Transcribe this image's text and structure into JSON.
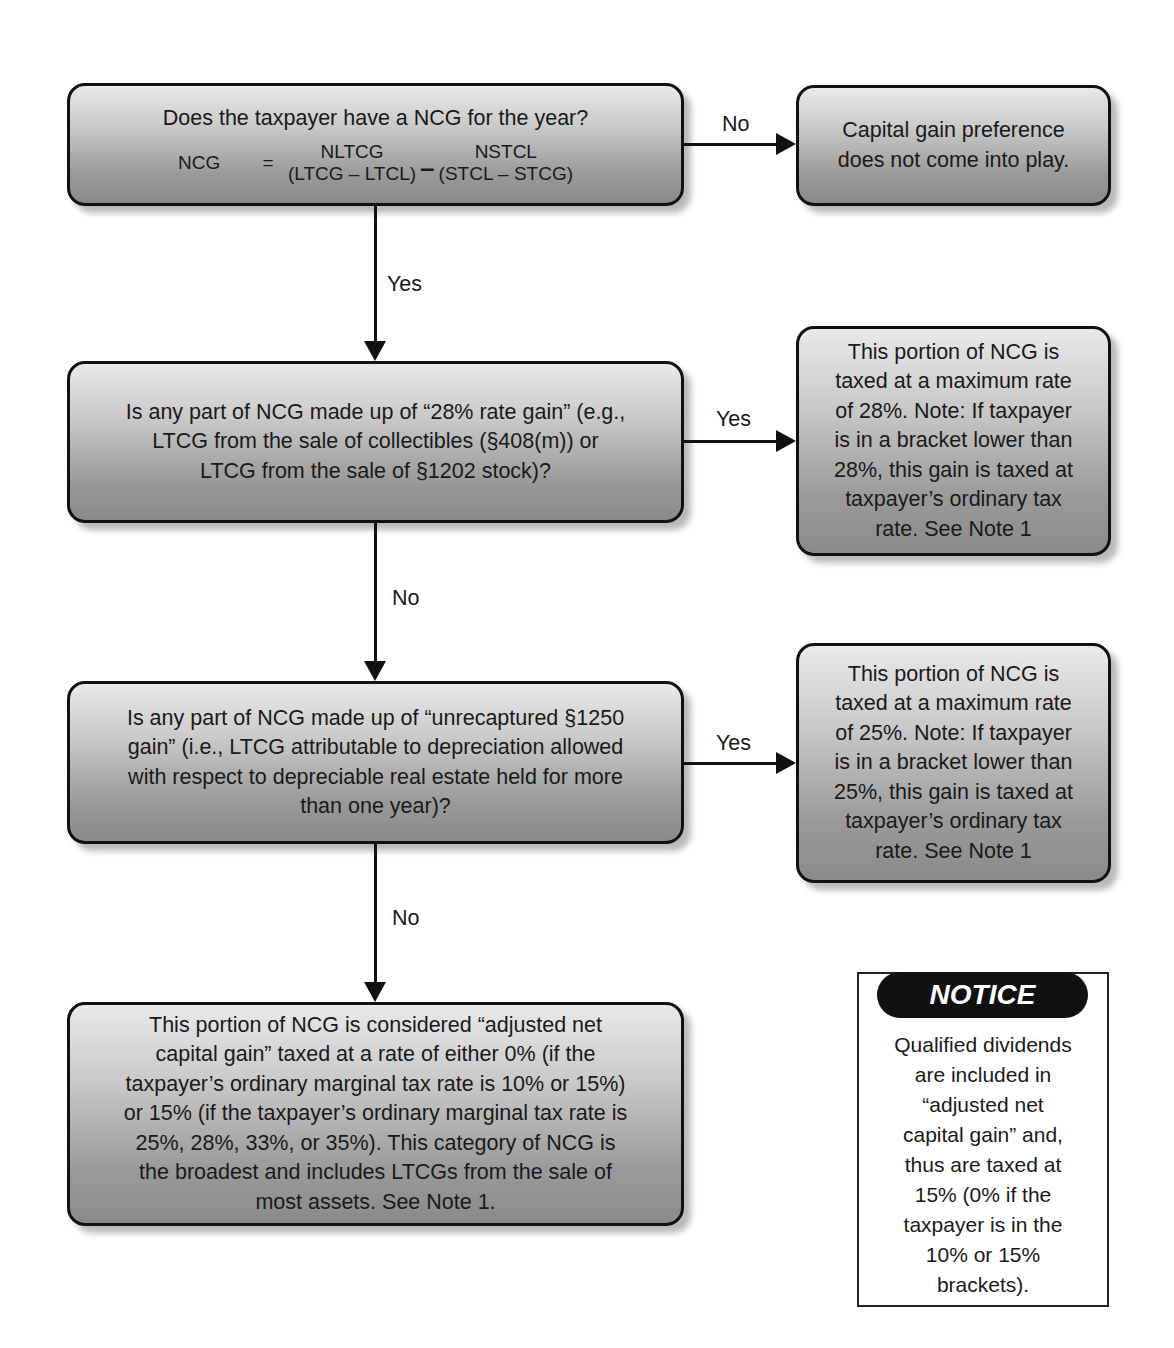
{
  "diagram": {
    "type": "flowchart",
    "nodes": {
      "q1": {
        "title": "Does the taxpayer have a NCG for the year?",
        "formula": {
          "lhs": "NCG",
          "equals": "=",
          "term1_top": "NLTCG",
          "term1_bottom": "(LTCG – LTCL)",
          "operator": "–",
          "term2_top": "NSTCL",
          "term2_bottom": "(STCL – STCG)"
        }
      },
      "r1": {
        "lines": [
          "Capital gain preference",
          "does not come into play."
        ]
      },
      "q2": {
        "lines": [
          "Is any part of NCG made up of “28% rate gain” (e.g.,",
          "LTCG from the sale of collectibles (§408(m)) or",
          "LTCG from the sale of §1202 stock)?"
        ]
      },
      "r2": {
        "lines": [
          "This portion of NCG is",
          "taxed at a maximum rate",
          "of 28%.  Note:  If taxpayer",
          "is in a bracket lower than",
          "28%, this gain is taxed at",
          "taxpayer’s ordinary tax",
          "rate.  See Note 1"
        ]
      },
      "q3": {
        "lines": [
          "Is any part of NCG made up of “unrecaptured §1250",
          "gain” (i.e., LTCG attributable to depreciation allowed",
          "with respect to depreciable real estate held for more",
          "than one year)?"
        ]
      },
      "r3": {
        "lines": [
          "This portion of NCG is",
          "taxed at a maximum rate",
          "of 25%.  Note:  If taxpayer",
          "is in a bracket lower than",
          "25%, this gain is taxed at",
          "taxpayer’s ordinary tax",
          "rate.  See Note 1"
        ]
      },
      "r4": {
        "lines": [
          "This portion of NCG is considered “adjusted net",
          "capital gain” taxed at a rate of either 0% (if the",
          "taxpayer’s ordinary marginal tax rate is 10% or 15%)",
          "or 15% (if the taxpayer’s ordinary marginal tax rate is",
          "25%, 28%, 33%, or 35%).  This category of NCG is",
          "the broadest and includes LTCGs from the sale of",
          "most assets.  See Note 1."
        ]
      }
    },
    "edges": {
      "q1_r1": "No",
      "q1_q2": "Yes",
      "q2_r2": "Yes",
      "q2_q3": "No",
      "q3_r3": "Yes",
      "q3_r4": "No"
    },
    "notice": {
      "heading": "NOTICE",
      "lines": [
        "Qualified dividends",
        "are included in",
        "“adjusted net",
        "capital gain” and,",
        "thus are taxed at",
        "15% (0% if the",
        "taxpayer is in the",
        "10% or 15%",
        "brackets)."
      ]
    },
    "colors": {
      "box_gradient_top": "#e9e9e9",
      "box_gradient_bottom": "#8a8a8a",
      "border": "#111111",
      "notice_pill": "#111111",
      "notice_text": "#ffffff"
    }
  }
}
